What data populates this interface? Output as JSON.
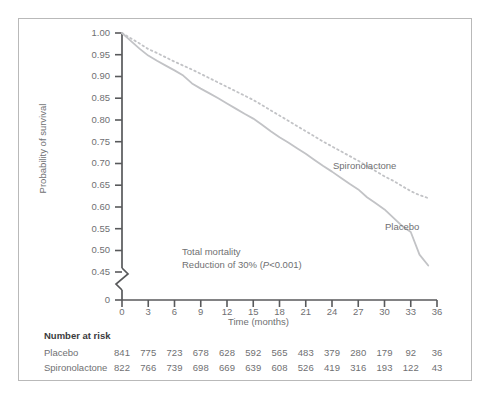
{
  "figure": {
    "ylabel": "Probability of survival",
    "xlabel": "Time (months)",
    "annotation_line1": "Total mortality",
    "annotation_line2_pre": "Reduction of 30% (",
    "annotation_line2_italic": "P",
    "annotation_line2_post": "<0.001)",
    "label_spironolactone": "Spironolactone",
    "label_placebo": "Placebo",
    "risk_title": "Number at risk"
  },
  "chart_data": {
    "type": "line",
    "title": "",
    "xlabel": "Time (months)",
    "ylabel": "Probability of survival",
    "xlim": [
      0,
      36
    ],
    "ylim": [
      0.45,
      1.0
    ],
    "axis_break": true,
    "axis_break_from": 0,
    "axis_break_to": 0.45,
    "grid": false,
    "legend_position": "inline-curve-labels",
    "xticks": [
      0,
      3,
      6,
      9,
      12,
      15,
      18,
      21,
      24,
      27,
      30,
      33,
      36
    ],
    "xtick_labels": [
      "0",
      "3",
      "6",
      "9",
      "12",
      "15",
      "18",
      "21",
      "24",
      "27",
      "30",
      "33",
      "36"
    ],
    "yticks": [
      0,
      0.45,
      0.5,
      0.55,
      0.6,
      0.65,
      0.7,
      0.75,
      0.8,
      0.85,
      0.9,
      0.95,
      1.0
    ],
    "ytick_labels": [
      "0",
      "0.45",
      "0.50",
      "0.55",
      "0.60",
      "0.65",
      "0.70",
      "0.75",
      "0.80",
      "0.85",
      "0.90",
      "0.95",
      "1.00"
    ],
    "annotations": [
      "Total mortality",
      "Reduction of 30% (P<0.001)"
    ],
    "series": [
      {
        "name": "Spironolactone",
        "style": "dotted",
        "color": "#c2c3c6",
        "x": [
          0,
          1,
          2,
          3,
          4,
          5,
          6,
          7,
          8,
          9,
          10,
          11,
          12,
          13,
          14,
          15,
          16,
          17,
          18,
          19,
          20,
          21,
          22,
          23,
          24,
          25,
          26,
          27,
          28,
          29,
          30,
          31,
          32,
          33,
          34,
          35
        ],
        "y": [
          1.0,
          0.988,
          0.976,
          0.963,
          0.954,
          0.944,
          0.934,
          0.925,
          0.916,
          0.906,
          0.896,
          0.886,
          0.876,
          0.866,
          0.856,
          0.846,
          0.834,
          0.822,
          0.81,
          0.798,
          0.786,
          0.774,
          0.762,
          0.75,
          0.739,
          0.728,
          0.717,
          0.706,
          0.694,
          0.682,
          0.67,
          0.66,
          0.648,
          0.636,
          0.627,
          0.62
        ]
      },
      {
        "name": "Placebo",
        "style": "solid",
        "color": "#c2c3c6",
        "x": [
          0,
          1,
          2,
          3,
          4,
          5,
          6,
          7,
          8,
          9,
          10,
          11,
          12,
          13,
          14,
          15,
          16,
          17,
          18,
          19,
          20,
          21,
          22,
          23,
          24,
          25,
          26,
          27,
          28,
          29,
          30,
          31,
          32,
          33,
          34,
          35
        ],
        "y": [
          1.0,
          0.982,
          0.964,
          0.948,
          0.936,
          0.925,
          0.914,
          0.902,
          0.884,
          0.872,
          0.861,
          0.85,
          0.838,
          0.826,
          0.814,
          0.803,
          0.789,
          0.774,
          0.76,
          0.748,
          0.735,
          0.722,
          0.708,
          0.694,
          0.681,
          0.667,
          0.653,
          0.64,
          0.622,
          0.608,
          0.594,
          0.575,
          0.556,
          0.542,
          0.49,
          0.465
        ]
      }
    ],
    "risk_table": {
      "title": "Number at risk",
      "times": [
        0,
        3,
        6,
        9,
        12,
        15,
        18,
        21,
        24,
        27,
        30,
        33,
        36
      ],
      "rows": [
        {
          "label": "Placebo",
          "values": [
            841,
            775,
            723,
            678,
            628,
            592,
            565,
            483,
            379,
            280,
            179,
            92,
            36
          ]
        },
        {
          "label": "Spironolactone",
          "values": [
            822,
            766,
            739,
            698,
            669,
            639,
            608,
            526,
            419,
            316,
            193,
            122,
            43
          ]
        }
      ]
    }
  }
}
